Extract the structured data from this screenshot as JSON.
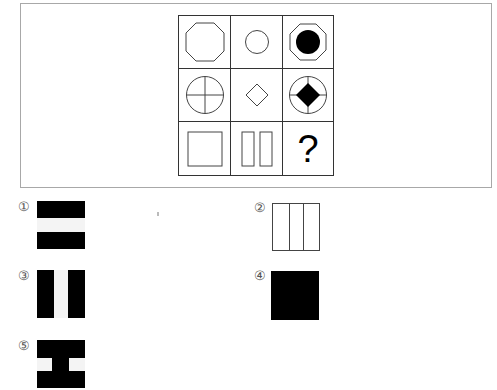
{
  "puzzle": {
    "grid": [
      [
        {
          "shape": "octagon-outline"
        },
        {
          "shape": "circle-outline"
        },
        {
          "shape": "octagon-with-filled-circle"
        }
      ],
      [
        {
          "shape": "circle-with-cross"
        },
        {
          "shape": "diamond-outline"
        },
        {
          "shape": "circle-with-cross-and-filled-diamond"
        }
      ],
      [
        {
          "shape": "square-outline"
        },
        {
          "shape": "two-vertical-rectangles"
        },
        {
          "shape": "question",
          "text": "?"
        }
      ]
    ],
    "colors": {
      "stroke": "#444444",
      "fill": "#000000",
      "frame": "#a8a8a8"
    }
  },
  "options": [
    {
      "label": "①",
      "description": "black square with white horizontal band"
    },
    {
      "label": "②",
      "description": "white square divided by two vertical lines"
    },
    {
      "label": "③",
      "description": "black square with white vertical band"
    },
    {
      "label": "④",
      "description": "solid black square"
    },
    {
      "label": "⑤",
      "description": "black square with two white side notches"
    }
  ]
}
